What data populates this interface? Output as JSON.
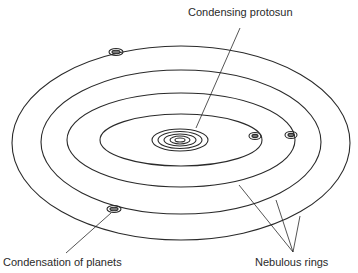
{
  "diagram": {
    "labels": {
      "protosun": "Condensing protosun",
      "planets": "Condensation of planets",
      "rings": "Nebulous rings"
    },
    "colors": {
      "stroke": "#2a2a2a",
      "background": "#ffffff"
    },
    "rings": [
      {
        "cx": 181,
        "cy": 143,
        "rx": 169,
        "ry": 97
      },
      {
        "cx": 181,
        "cy": 142,
        "rx": 140,
        "ry": 72
      },
      {
        "cx": 181,
        "cy": 140,
        "rx": 114,
        "ry": 47
      },
      {
        "cx": 181,
        "cy": 140,
        "rx": 81,
        "ry": 26
      }
    ],
    "protosun_rings": 5,
    "planets": [
      {
        "x": 116,
        "y": 52
      },
      {
        "x": 255,
        "y": 136
      },
      {
        "x": 291,
        "y": 135
      },
      {
        "x": 114,
        "y": 209
      }
    ]
  }
}
